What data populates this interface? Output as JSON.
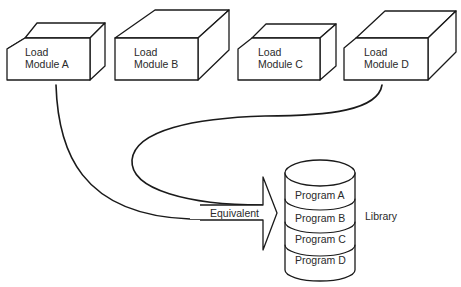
{
  "diagram": {
    "load_modules": [
      {
        "line1": "Load",
        "line2": "Module A"
      },
      {
        "line1": "Load",
        "line2": "Module B"
      },
      {
        "line1": "Load",
        "line2": "Module C"
      },
      {
        "line1": "Load",
        "line2": "Module D"
      }
    ],
    "arrow_label": "Equivalent",
    "library": {
      "label": "Library",
      "programs": [
        "Program A",
        "Program B",
        "Program C",
        "Program D"
      ]
    },
    "colors": {
      "stroke": "#1a1a1a",
      "background": "#ffffff",
      "text": "#2a2a2a"
    }
  }
}
